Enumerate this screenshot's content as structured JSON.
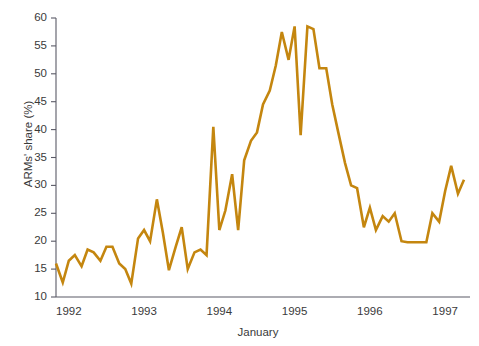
{
  "chart_data": {
    "type": "line",
    "title": "",
    "subtitle": "",
    "xlabel": "January",
    "ylabel": "ARMs' share (%)",
    "xlim": [
      1991.83,
      1997.33
    ],
    "ylim": [
      10,
      60
    ],
    "ytick_values": [
      10,
      15,
      20,
      25,
      30,
      35,
      40,
      45,
      50,
      55,
      60
    ],
    "ytick_labels": [
      "10",
      "15",
      "20",
      "25",
      "30",
      "35",
      "40",
      "45",
      "50",
      "55",
      "60"
    ],
    "xtick_values": [
      1992,
      1993,
      1994,
      1995,
      1996,
      1997
    ],
    "xtick_labels": [
      "1992",
      "1993",
      "1994",
      "1995",
      "1996",
      "1997"
    ],
    "grid": false,
    "legend": null,
    "line_color": "#c4860f",
    "line_width": 2.6,
    "axis_color": "#5a5a66",
    "series": [
      {
        "name": "ARMs' share",
        "x": [
          1991.83,
          1991.92,
          1992.0,
          1992.08,
          1992.17,
          1992.25,
          1992.33,
          1992.42,
          1992.5,
          1992.58,
          1992.67,
          1992.75,
          1992.83,
          1992.92,
          1993.0,
          1993.08,
          1993.17,
          1993.25,
          1993.33,
          1993.42,
          1993.5,
          1993.58,
          1993.67,
          1993.75,
          1993.83,
          1993.92,
          1994.0,
          1994.08,
          1994.17,
          1994.25,
          1994.33,
          1994.42,
          1994.5,
          1994.58,
          1994.67,
          1994.75,
          1994.83,
          1994.92,
          1995.0,
          1995.08,
          1995.17,
          1995.25,
          1995.33,
          1995.42,
          1995.5,
          1995.58,
          1995.67,
          1995.75,
          1995.83,
          1995.92,
          1996.0,
          1996.08,
          1996.17,
          1996.25,
          1996.33,
          1996.42,
          1996.5,
          1996.58,
          1996.67,
          1996.75,
          1996.83,
          1996.92,
          1997.0,
          1997.08,
          1997.17,
          1997.25
        ],
        "values": [
          16.0,
          12.6,
          16.5,
          17.5,
          15.5,
          18.5,
          18.0,
          16.5,
          19.0,
          19.0,
          16.0,
          15.0,
          12.4,
          20.5,
          22.0,
          20.0,
          27.5,
          21.5,
          14.8,
          19.0,
          22.5,
          15.0,
          18.0,
          18.5,
          17.5,
          40.5,
          22.0,
          25.5,
          32.0,
          22.0,
          34.5,
          38.0,
          39.5,
          44.5,
          47.0,
          51.5,
          57.5,
          52.5,
          58.5,
          39.0,
          58.5,
          58.0,
          51.0,
          51.0,
          44.5,
          39.5,
          34.0,
          30.0,
          29.5,
          22.5,
          26.0,
          22.0,
          24.5,
          23.5,
          25.0,
          20.0,
          19.8,
          19.8,
          19.8,
          19.8,
          25.0,
          23.5,
          29.0,
          33.5,
          28.5,
          31.0
        ]
      }
    ],
    "annotations": []
  }
}
